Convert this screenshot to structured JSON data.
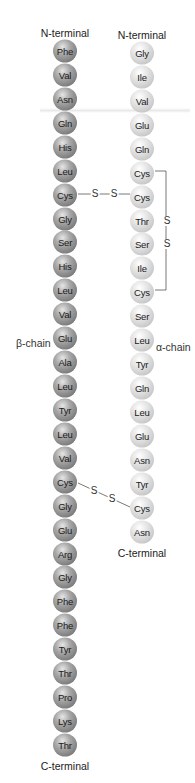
{
  "beta_chain": {
    "label": "β-chain",
    "n_terminal": "N-terminal",
    "c_terminal": "C-terminal",
    "residues": [
      "Phe",
      "Val",
      "Asn",
      "Gln",
      "His",
      "Leu",
      "Cys",
      "Gly",
      "Ser",
      "His",
      "Leu",
      "Val",
      "Glu",
      "Ala",
      "Leu",
      "Tyr",
      "Leu",
      "Val",
      "Cys",
      "Gly",
      "Glu",
      "Arg",
      "Gly",
      "Phe",
      "Phe",
      "Tyr",
      "Thr",
      "Pro",
      "Lys",
      "Thr"
    ]
  },
  "alpha_chain": {
    "label": "α-chain",
    "n_terminal": "N-terminal",
    "c_terminal": "C-terminal",
    "residues": [
      "Gly",
      "Ile",
      "Val",
      "Glu",
      "Gln",
      "Cys",
      "Cys",
      "Thr",
      "Ser",
      "Ile",
      "Cys",
      "Ser",
      "Leu",
      "Tyr",
      "Gln",
      "Leu",
      "Glu",
      "Asn",
      "Tyr",
      "Cys",
      "Asn"
    ]
  },
  "disulfide_bonds": [
    {
      "type": "interchain",
      "from": "beta Cys7",
      "to": "alpha Cys7",
      "atoms": [
        "S",
        "S"
      ]
    },
    {
      "type": "interchain",
      "from": "beta Cys19",
      "to": "alpha Cys20",
      "atoms": [
        "S",
        "S"
      ]
    },
    {
      "type": "intrachain",
      "from": "alpha Cys6",
      "to": "alpha Cys11",
      "atoms": [
        "S",
        "S"
      ]
    }
  ],
  "colors": {
    "beta_bead": "#8a8a8a",
    "alpha_bead": "#d2d2d2",
    "text": "#222222",
    "bond_line": "#555555"
  }
}
